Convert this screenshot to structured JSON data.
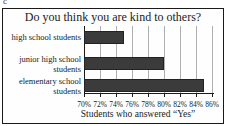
{
  "page": {
    "corner_mark": "c"
  },
  "chart_data": {
    "type": "bar",
    "orientation": "horizontal",
    "title": "Do you think you are kind to others?",
    "categories": [
      "high school students",
      "junior high school students",
      "elementary school students"
    ],
    "category_lines": [
      [
        "high school students"
      ],
      [
        "junior high school",
        "students"
      ],
      [
        "elementary school",
        "students"
      ]
    ],
    "values": [
      75,
      80,
      85
    ],
    "value_unit": "%",
    "xlabel": "Students who answered “Yes”",
    "xlim": [
      70,
      86
    ],
    "xtick_step": 2,
    "xtick_labels": [
      "70%",
      "72%",
      "74%",
      "76%",
      "78%",
      "80%",
      "82%",
      "84%",
      "86%"
    ],
    "grid": true,
    "legend": "none",
    "bar_color": "#3b3b3b",
    "bar_border_color": "#222222",
    "grid_color": "#b0b0b0",
    "axis_color": "#1a1a1a"
  }
}
